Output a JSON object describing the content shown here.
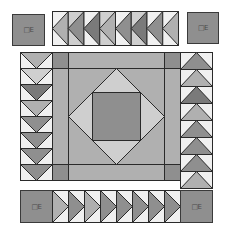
{
  "quilt": {
    "colors": {
      "outline": "#2a2a2a",
      "white": "#f0f0f0",
      "light": "#cfcfcf",
      "mid": "#b0b0b0",
      "dark": "#8f8f8f",
      "darker": "#7a7a7a"
    },
    "corner_blocks": {
      "top_left": {
        "label": "□E"
      },
      "top_right": {
        "label": "□E"
      },
      "bottom_left": {
        "label": "□E"
      },
      "bottom_right": {
        "label": "□E"
      }
    },
    "top_border": {
      "direction": "left",
      "triangle_count": 8
    },
    "bottom_border": {
      "direction": "right",
      "triangle_count": 8
    },
    "left_border": {
      "direction": "down",
      "triangle_count": 8
    },
    "right_border": {
      "direction": "up",
      "triangle_count": 8
    },
    "center_block": {
      "type": "square-in-a-square",
      "layers": [
        "outer-frame",
        "diamond",
        "inner-square"
      ]
    }
  }
}
